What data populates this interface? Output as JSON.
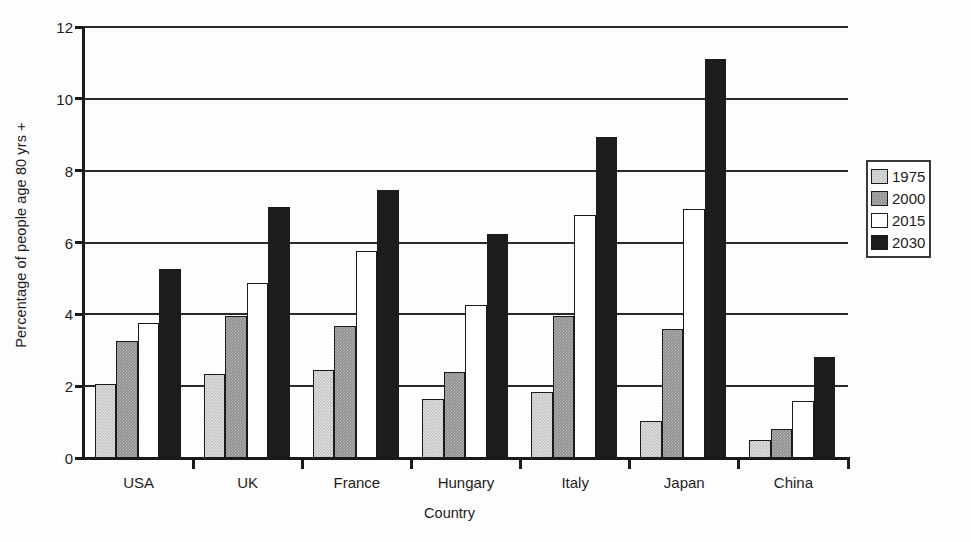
{
  "chart_data": {
    "type": "bar",
    "title": "",
    "xlabel": "Country",
    "ylabel": "Percentage of people age 80 yrs +",
    "ylim": [
      0,
      12
    ],
    "ytick_labels": [
      "0",
      "2",
      "4",
      "6",
      "8",
      "10",
      "12"
    ],
    "yticks": [
      0,
      2,
      4,
      6,
      8,
      10,
      12
    ],
    "grid": true,
    "grid_axis": "y",
    "legend_position": "right",
    "categories": [
      "USA",
      "UK",
      "France",
      "Hungary",
      "Italy",
      "Japan",
      "China"
    ],
    "series": [
      {
        "name": "1975",
        "color": "#c3c3c3",
        "values": [
          2.05,
          2.35,
          2.45,
          1.65,
          1.85,
          1.03,
          0.5
        ]
      },
      {
        "name": "2000",
        "color": "#8d8d8d",
        "values": [
          3.25,
          3.95,
          3.67,
          2.4,
          3.95,
          3.6,
          0.8
        ]
      },
      {
        "name": "2015",
        "color": "#ffffff",
        "values": [
          3.75,
          4.88,
          5.75,
          4.25,
          6.78,
          6.93,
          1.6
        ]
      },
      {
        "name": "2030",
        "color": "#1d1d1d",
        "values": [
          5.27,
          7.0,
          7.47,
          6.25,
          8.95,
          11.1,
          2.8
        ]
      }
    ]
  },
  "legend": {
    "items": [
      {
        "label": "1975"
      },
      {
        "label": "2000"
      },
      {
        "label": "2015"
      },
      {
        "label": "2030"
      }
    ]
  }
}
